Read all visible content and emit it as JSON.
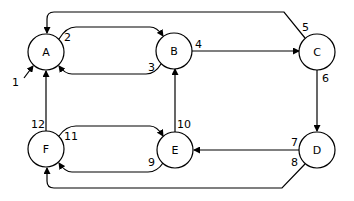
{
  "diagram": {
    "type": "directed-graph",
    "nodes": [
      {
        "id": "A",
        "label": "A"
      },
      {
        "id": "B",
        "label": "B"
      },
      {
        "id": "C",
        "label": "C"
      },
      {
        "id": "D",
        "label": "D"
      },
      {
        "id": "E",
        "label": "E"
      },
      {
        "id": "F",
        "label": "F"
      }
    ],
    "edges": [
      {
        "id": "1",
        "label": "1",
        "from": "external",
        "to": "A"
      },
      {
        "id": "2",
        "label": "2",
        "from": "A",
        "to": "B"
      },
      {
        "id": "3",
        "label": "3",
        "from": "B",
        "to": "A"
      },
      {
        "id": "4",
        "label": "4",
        "from": "B",
        "to": "C"
      },
      {
        "id": "5",
        "label": "5",
        "from": "C",
        "to": "A"
      },
      {
        "id": "6",
        "label": "6",
        "from": "C",
        "to": "D"
      },
      {
        "id": "7",
        "label": "7",
        "from": "D",
        "to": "E"
      },
      {
        "id": "8",
        "label": "8",
        "from": "D",
        "to": "F"
      },
      {
        "id": "9",
        "label": "9",
        "from": "E",
        "to": "F"
      },
      {
        "id": "10",
        "label": "10",
        "from": "E",
        "to": "B"
      },
      {
        "id": "11",
        "label": "11",
        "from": "F",
        "to": "E"
      },
      {
        "id": "12",
        "label": "12",
        "from": "F",
        "to": "A"
      }
    ]
  }
}
